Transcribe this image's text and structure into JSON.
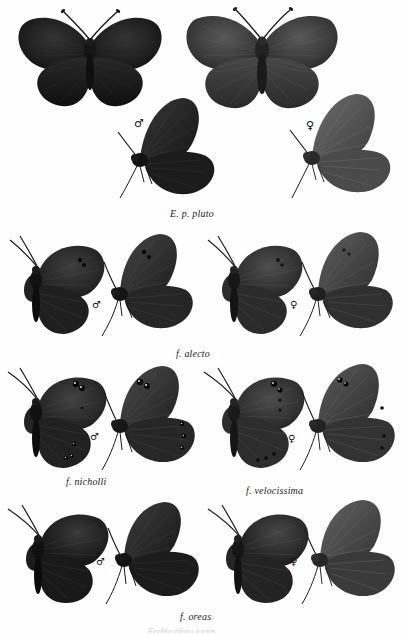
{
  "plate": {
    "kind": "scientific-specimen-plate",
    "subject": "Erebia pluto forms",
    "background_color": "#fefefe",
    "ink_color": "#1d1d1d",
    "width": 405,
    "height": 634
  },
  "symbols": {
    "male": "♂",
    "female": "♀"
  },
  "rows": [
    {
      "id": "row-pluto",
      "caption": "E. p. pluto",
      "caption_x": 170,
      "caption_y": 210,
      "specimens": [
        {
          "name": "pluto-male-dorsal",
          "sex": "male",
          "view": "dorsal",
          "x": 14,
          "y": 8,
          "w": 150,
          "h": 105,
          "tone": "#1a1a1a",
          "tone2": "#2c2c2c",
          "spots": []
        },
        {
          "name": "pluto-female-dorsal",
          "sex": "female",
          "view": "dorsal",
          "x": 182,
          "y": 4,
          "w": 160,
          "h": 112,
          "tone": "#3a3a3a",
          "tone2": "#4a4a4a",
          "spots": []
        },
        {
          "name": "pluto-male-ventral",
          "sex": "male",
          "view": "ventral",
          "x": 120,
          "y": 100,
          "w": 100,
          "h": 105,
          "tone": "#1e1e1e",
          "tone2": "#2f2f2f",
          "spots": []
        },
        {
          "name": "pluto-female-ventral",
          "sex": "female",
          "view": "ventral",
          "x": 290,
          "y": 96,
          "w": 105,
          "h": 110,
          "tone": "#4c4c4c",
          "tone2": "#5c5c5c",
          "spots": []
        }
      ],
      "sex_marks": [
        {
          "sex": "male",
          "x": 134,
          "y": 118
        },
        {
          "sex": "female",
          "x": 306,
          "y": 120
        }
      ]
    },
    {
      "id": "row-alecto",
      "caption": "f. alecto",
      "caption_prefix": "f.",
      "caption_x": 178,
      "caption_y": 349,
      "specimens": [
        {
          "name": "alecto-male-dorsal",
          "sex": "male",
          "view": "dorsal",
          "x": 2,
          "y": 236,
          "w": 110,
          "h": 100,
          "tone": "#242424",
          "tone2": "#343434",
          "spots": [
            [
              78,
              22
            ],
            [
              82,
              27
            ]
          ]
        },
        {
          "name": "alecto-male-ventral",
          "sex": "male",
          "view": "ventral",
          "x": 100,
          "y": 234,
          "w": 98,
          "h": 104,
          "tone": "#2b2b2b",
          "tone2": "#3b3b3b",
          "spots": [
            [
              52,
              20
            ],
            [
              57,
              25
            ]
          ]
        },
        {
          "name": "alecto-female-dorsal",
          "sex": "female",
          "view": "dorsal",
          "x": 200,
          "y": 236,
          "w": 110,
          "h": 100,
          "tone": "#2e2e2e",
          "tone2": "#3e3e3e",
          "spots": [
            [
              78,
              22
            ],
            [
              82,
              27
            ]
          ]
        },
        {
          "name": "alecto-female-ventral",
          "sex": "female",
          "view": "ventral",
          "x": 300,
          "y": 232,
          "w": 100,
          "h": 108,
          "tone": "#3d3d3d",
          "tone2": "#4d4d4d",
          "spots": [
            [
              52,
              20
            ],
            [
              57,
              25
            ]
          ]
        }
      ],
      "sex_marks": [
        {
          "sex": "male",
          "x": 92,
          "y": 305
        },
        {
          "sex": "female",
          "x": 290,
          "y": 305
        }
      ]
    },
    {
      "id": "row-nicholli-velocissima",
      "caption_left": "f. nicholli",
      "caption_left_x": 68,
      "caption_left_y": 477,
      "caption_right": "f. velocissima",
      "caption_right_x": 248,
      "caption_right_y": 486,
      "specimens": [
        {
          "name": "nicholli-male-dorsal",
          "sex": "male",
          "view": "dorsal",
          "x": 2,
          "y": 368,
          "w": 110,
          "h": 102,
          "tone": "#262626",
          "tone2": "#363636",
          "spots": [
            [
              72,
              14
            ],
            [
              78,
              17
            ],
            [
              68,
              58
            ],
            [
              73,
              61
            ],
            [
              60,
              72
            ],
            [
              65,
              74
            ]
          ]
        },
        {
          "name": "nicholli-male-ventral",
          "sex": "male",
          "view": "ventral",
          "x": 100,
          "y": 366,
          "w": 98,
          "h": 106,
          "tone": "#2c2c2c",
          "tone2": "#3c3c3c",
          "spots": [
            [
              44,
              14
            ],
            [
              50,
              17
            ],
            [
              78,
              56
            ],
            [
              80,
              66
            ],
            [
              80,
              76
            ]
          ]
        },
        {
          "name": "velocissima-female-dorsal",
          "sex": "female",
          "view": "dorsal",
          "x": 200,
          "y": 368,
          "w": 110,
          "h": 102,
          "tone": "#303030",
          "tone2": "#404040",
          "spots": [
            [
              72,
              14
            ],
            [
              76,
              22
            ],
            [
              74,
              32
            ],
            [
              58,
              70
            ],
            [
              64,
              72
            ],
            [
              70,
              74
            ]
          ]
        },
        {
          "name": "velocissima-female-ventral",
          "sex": "female",
          "view": "ventral",
          "x": 300,
          "y": 364,
          "w": 100,
          "h": 108,
          "tone": "#3b3b3b",
          "tone2": "#4b4b4b",
          "spots": [
            [
              44,
              14
            ],
            [
              50,
              16
            ],
            [
              80,
              44
            ],
            [
              82,
              70
            ],
            [
              84,
              80
            ]
          ]
        }
      ],
      "sex_marks": [
        {
          "sex": "male",
          "x": 90,
          "y": 436
        },
        {
          "sex": "female",
          "x": 288,
          "y": 438
        }
      ]
    },
    {
      "id": "row-oreas",
      "caption": "f. oreas",
      "caption_x": 182,
      "caption_y": 613,
      "specimens": [
        {
          "name": "oreas-male-dorsal",
          "sex": "male",
          "view": "dorsal",
          "x": 2,
          "y": 505,
          "w": 110,
          "h": 100,
          "tone": "#1c1c1c",
          "tone2": "#2c2c2c",
          "spots": []
        },
        {
          "name": "oreas-male-ventral",
          "sex": "male",
          "view": "ventral",
          "x": 104,
          "y": 502,
          "w": 98,
          "h": 104,
          "tone": "#202020",
          "tone2": "#303030",
          "spots": []
        },
        {
          "name": "oreas-female-dorsal",
          "sex": "female",
          "view": "dorsal",
          "x": 202,
          "y": 505,
          "w": 110,
          "h": 100,
          "tone": "#2a2a2a",
          "tone2": "#3a3a3a",
          "spots": []
        },
        {
          "name": "oreas-female-ventral",
          "sex": "female",
          "view": "ventral",
          "x": 300,
          "y": 500,
          "w": 102,
          "h": 106,
          "tone": "#3e3e3e",
          "tone2": "#4e4e4e",
          "spots": []
        }
      ],
      "sex_marks": [
        {
          "sex": "male",
          "x": 96,
          "y": 561
        },
        {
          "sex": "female",
          "x": 290,
          "y": 561
        }
      ]
    }
  ],
  "footer": {
    "cut_off_line": "Erebia pluto forms",
    "cut_off_x": 150,
    "cut_off_y": 626
  }
}
